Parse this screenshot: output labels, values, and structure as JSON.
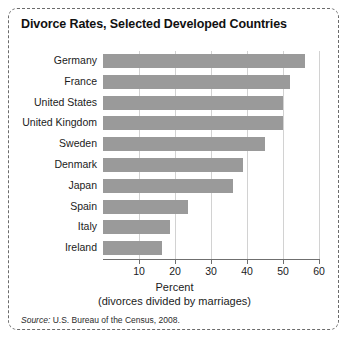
{
  "figure": {
    "title": "Divorce Rates, Selected Developed Countries",
    "source_word": "Source:",
    "source_text": " U.S. Bureau of the Census, 2008.",
    "bar_color": "#9a9a9a",
    "gridline_color": "#d2d2d2",
    "axis_color": "#6f6f6f",
    "border_color": "#6b6b6b"
  },
  "chart_data": {
    "type": "bar",
    "orientation": "horizontal",
    "title": "Divorce Rates, Selected Developed Countries",
    "xlabel": "Percent",
    "xlabel_sub": "(divorces divided by marriages)",
    "ylabel": "",
    "xlim": [
      0,
      60
    ],
    "xticks": [
      10,
      20,
      30,
      40,
      50,
      60
    ],
    "grid": true,
    "legend": false,
    "categories": [
      "Germany",
      "France",
      "United States",
      "United Kingdom",
      "Sweden",
      "Denmark",
      "Japan",
      "Spain",
      "Italy",
      "Ireland"
    ],
    "values": [
      56,
      52,
      50,
      50,
      45,
      39,
      36,
      23.5,
      18.5,
      16.5
    ]
  }
}
